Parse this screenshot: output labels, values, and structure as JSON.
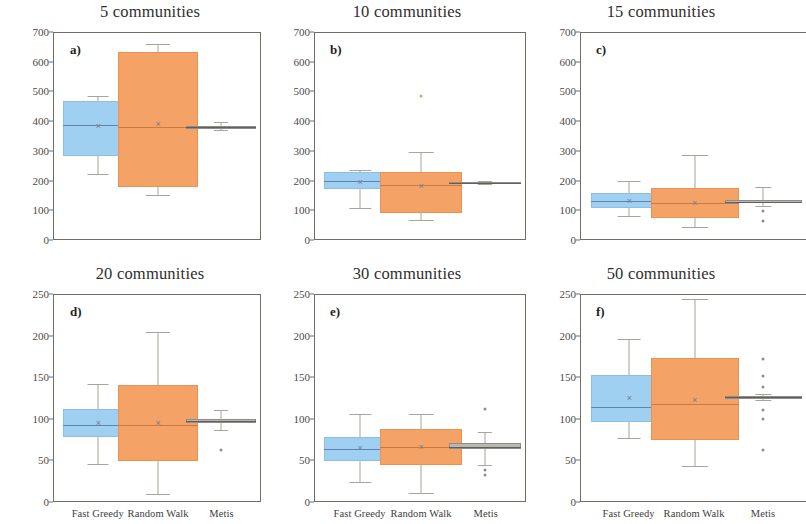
{
  "figure": {
    "ylabel": "Number of Nodes",
    "categories": [
      "Fast Greedy",
      "Random Walk",
      "Metis"
    ],
    "colors": {
      "fast_greedy": "#9fcff1",
      "random_walk": "#f4a265",
      "metis": "#b9b7b2",
      "frame": "#6f6f66",
      "text": "#2e2e2e"
    }
  },
  "chart_data": [
    {
      "type": "box",
      "panel": "a)",
      "title": "5 communities",
      "xlabel": "",
      "ylabel": "Number of Nodes",
      "ylim": [
        0,
        700
      ],
      "yticks": [
        0,
        100,
        200,
        300,
        400,
        500,
        600,
        700
      ],
      "grid": false,
      "categories": [
        "Fast Greedy",
        "Random Walk",
        "Metis"
      ],
      "series": [
        {
          "name": "Fast Greedy",
          "color": "#9fcff1",
          "min": 222,
          "q1": 282,
          "median": 388,
          "mean": 385,
          "q3": 470,
          "max": 487,
          "outliers": []
        },
        {
          "name": "Random Walk",
          "color": "#f4a265",
          "min": 148,
          "q1": 178,
          "median": 380,
          "mean": 390,
          "q3": 634,
          "max": 662,
          "outliers": []
        },
        {
          "name": "Metis",
          "color": "#b9b7b2",
          "min": 372,
          "q1": 374,
          "median": 380,
          "mean": 380,
          "q3": 384,
          "max": 396,
          "outliers": []
        }
      ]
    },
    {
      "type": "box",
      "panel": "b)",
      "title": "10 communities",
      "xlabel": "",
      "ylabel": "",
      "ylim": [
        0,
        700
      ],
      "yticks": [
        0,
        100,
        200,
        300,
        400,
        500,
        600,
        700
      ],
      "grid": false,
      "categories": [
        "Fast Greedy",
        "Random Walk",
        "Metis"
      ],
      "series": [
        {
          "name": "Fast Greedy",
          "color": "#9fcff1",
          "min": 105,
          "q1": 170,
          "median": 196,
          "mean": 192,
          "q3": 228,
          "max": 236,
          "outliers": []
        },
        {
          "name": "Random Walk",
          "color": "#f4a265",
          "min": 64,
          "q1": 88,
          "median": 182,
          "mean": 180,
          "q3": 228,
          "max": 295,
          "outliers": [
            485
          ]
        },
        {
          "name": "Metis",
          "color": "#b9b7b2",
          "min": 186,
          "q1": 188,
          "median": 190,
          "mean": 190,
          "q3": 192,
          "max": 196,
          "outliers": []
        }
      ]
    },
    {
      "type": "box",
      "panel": "c)",
      "title": "15 communities",
      "xlabel": "",
      "ylabel": "",
      "ylim": [
        0,
        700
      ],
      "yticks": [
        0,
        100,
        200,
        300,
        400,
        500,
        600,
        700
      ],
      "grid": false,
      "categories": [
        "Fast Greedy",
        "Random Walk",
        "Metis"
      ],
      "series": [
        {
          "name": "Fast Greedy",
          "color": "#9fcff1",
          "min": 78,
          "q1": 106,
          "median": 128,
          "mean": 130,
          "q3": 155,
          "max": 198,
          "outliers": []
        },
        {
          "name": "Random Walk",
          "color": "#f4a265",
          "min": 42,
          "q1": 72,
          "median": 122,
          "mean": 124,
          "q3": 172,
          "max": 285,
          "outliers": []
        },
        {
          "name": "Metis",
          "color": "#b9b7b2",
          "min": 112,
          "q1": 122,
          "median": 126,
          "mean": 127,
          "q3": 132,
          "max": 178,
          "outliers": [
            95,
            62
          ]
        }
      ]
    },
    {
      "type": "box",
      "panel": "d)",
      "title": "20 communities",
      "xlabel": "",
      "ylabel": "Number of Nodes",
      "ylim": [
        0,
        250
      ],
      "yticks": [
        0,
        50,
        100,
        150,
        200,
        250
      ],
      "grid": false,
      "categories": [
        "Fast Greedy",
        "Random Walk",
        "Metis"
      ],
      "series": [
        {
          "name": "Fast Greedy",
          "color": "#9fcff1",
          "min": 45,
          "q1": 78,
          "median": 92,
          "mean": 95,
          "q3": 112,
          "max": 142,
          "outliers": []
        },
        {
          "name": "Random Walk",
          "color": "#f4a265",
          "min": 9,
          "q1": 49,
          "median": 92,
          "mean": 95,
          "q3": 141,
          "max": 205,
          "outliers": []
        },
        {
          "name": "Metis",
          "color": "#b9b7b2",
          "min": 86,
          "q1": 95,
          "median": 97,
          "mean": 97,
          "q3": 100,
          "max": 110,
          "outliers": [
            62
          ]
        }
      ]
    },
    {
      "type": "box",
      "panel": "e)",
      "title": "30 communities",
      "xlabel": "",
      "ylabel": "",
      "ylim": [
        0,
        250
      ],
      "yticks": [
        0,
        50,
        100,
        150,
        200,
        250
      ],
      "grid": false,
      "categories": [
        "Fast Greedy",
        "Random Walk",
        "Metis"
      ],
      "series": [
        {
          "name": "Fast Greedy",
          "color": "#9fcff1",
          "min": 23,
          "q1": 48,
          "median": 63,
          "mean": 64,
          "q3": 78,
          "max": 106,
          "outliers": []
        },
        {
          "name": "Random Walk",
          "color": "#f4a265",
          "min": 10,
          "q1": 44,
          "median": 66,
          "mean": 66,
          "q3": 87,
          "max": 105,
          "outliers": []
        },
        {
          "name": "Metis",
          "color": "#b9b7b2",
          "min": 44,
          "q1": 63,
          "median": 66,
          "mean": 66,
          "q3": 70,
          "max": 84,
          "outliers": [
            112,
            38,
            32
          ]
        }
      ]
    },
    {
      "type": "box",
      "panel": "f)",
      "title": "50 communities",
      "xlabel": "",
      "ylabel": "",
      "ylim": [
        0,
        250
      ],
      "yticks": [
        0,
        50,
        100,
        150,
        200,
        250
      ],
      "grid": false,
      "categories": [
        "Fast Greedy",
        "Random Walk",
        "Metis"
      ],
      "series": [
        {
          "name": "Fast Greedy",
          "color": "#9fcff1",
          "min": 77,
          "q1": 96,
          "median": 114,
          "mean": 125,
          "q3": 153,
          "max": 196,
          "outliers": []
        },
        {
          "name": "Random Walk",
          "color": "#f4a265",
          "min": 43,
          "q1": 74,
          "median": 118,
          "mean": 122,
          "q3": 173,
          "max": 245,
          "outliers": []
        },
        {
          "name": "Metis",
          "color": "#b9b7b2",
          "min": 122,
          "q1": 124,
          "median": 126,
          "mean": 126,
          "q3": 128,
          "max": 130,
          "outliers": [
            172,
            152,
            138,
            110,
            100,
            62
          ]
        }
      ]
    }
  ]
}
